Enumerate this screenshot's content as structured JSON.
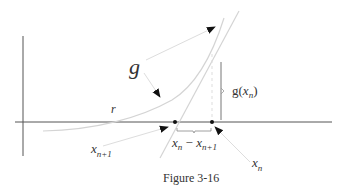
{
  "figure": {
    "caption": "Figure 3-16",
    "labels": {
      "g": "g",
      "r": "r",
      "g_xn_prefix": "g(",
      "g_xn_var": "x",
      "g_xn_sub": "n",
      "g_xn_suffix": ")",
      "diff_x1": "x",
      "diff_sub1": "n",
      "diff_minus": " − ",
      "diff_x2": "x",
      "diff_sub2": "n+1",
      "xn1_var": "x",
      "xn1_sub": "n+1",
      "xn_var": "x",
      "xn_sub": "n"
    },
    "colors": {
      "axis": "#555555",
      "curve": "#d4d4d4",
      "tangent": "#d4d4d4",
      "pointer": "#dddddd",
      "arrowhead": "#111111",
      "bracket": "#777777",
      "dashed": "#dddddd",
      "dot": "#111111"
    }
  }
}
